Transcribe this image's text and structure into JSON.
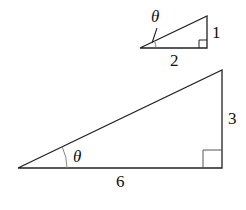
{
  "small_triangle": {
    "adjacent": "2",
    "opposite": "1",
    "angle": "θ"
  },
  "large_triangle": {
    "adjacent": "6",
    "opposite": "3",
    "angle": "θ"
  }
}
